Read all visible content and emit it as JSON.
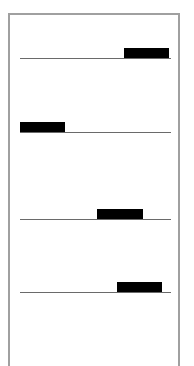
{
  "diagram": {
    "colors": {
      "frame": "#a0a0a0",
      "track": "#6a6a6a",
      "block": "#000000",
      "background": "#ffffff"
    },
    "tracks": [
      {
        "y": 58,
        "block": {
          "x": 124,
          "width": 45
        }
      },
      {
        "y": 132,
        "block": {
          "x": 20,
          "width": 45
        }
      },
      {
        "y": 219,
        "block": {
          "x": 97,
          "width": 46
        }
      },
      {
        "y": 292,
        "block": {
          "x": 117,
          "width": 45
        }
      }
    ]
  }
}
